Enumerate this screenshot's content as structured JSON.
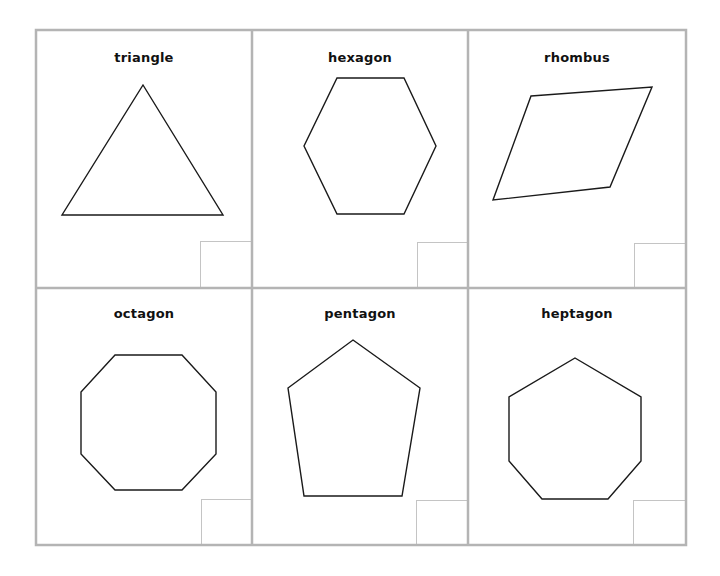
{
  "worksheet": {
    "grid": {
      "left": 36,
      "top": 30,
      "right": 686,
      "bottom": 545,
      "col_dividers": [
        252,
        468
      ],
      "row_divider": 288,
      "border_color": "#b4b4b4",
      "inner_box_color": "#c4c4c4"
    },
    "cards": [
      {
        "label": "triangle",
        "x": 36,
        "y": 30,
        "w": 216,
        "h": 258,
        "label_y": 20,
        "points": "143,85 223,215 62,215",
        "box": [
          200,
          241,
          52,
          47
        ]
      },
      {
        "label": "hexagon",
        "x": 252,
        "y": 30,
        "w": 216,
        "h": 258,
        "label_y": 20,
        "points": "337,78 404,78 436,146 404,214 337,214 304,146",
        "box": [
          417,
          242,
          51,
          46
        ]
      },
      {
        "label": "rhombus",
        "x": 468,
        "y": 30,
        "w": 218,
        "h": 258,
        "label_y": 20,
        "points": "531,96 652,87 610,187 493,200",
        "box": [
          634,
          243,
          52,
          45
        ]
      },
      {
        "label": "octagon",
        "x": 36,
        "y": 288,
        "w": 216,
        "h": 257,
        "label_y": 18,
        "points": "115,355 182,355 216,392 216,454 182,490 115,490 81,454 81,392",
        "box": [
          201,
          499,
          51,
          46
        ]
      },
      {
        "label": "pentagon",
        "x": 252,
        "y": 288,
        "w": 216,
        "h": 257,
        "label_y": 18,
        "points": "353,340 420,388 402,496 304,496 288,388",
        "box": [
          416,
          500,
          52,
          45
        ]
      },
      {
        "label": "heptagon",
        "x": 468,
        "y": 288,
        "w": 218,
        "h": 257,
        "label_y": 18,
        "points": "575,358 641,397 641,461 608,499 542,499 509,461 509,397",
        "box": [
          633,
          500,
          53,
          45
        ]
      }
    ]
  }
}
